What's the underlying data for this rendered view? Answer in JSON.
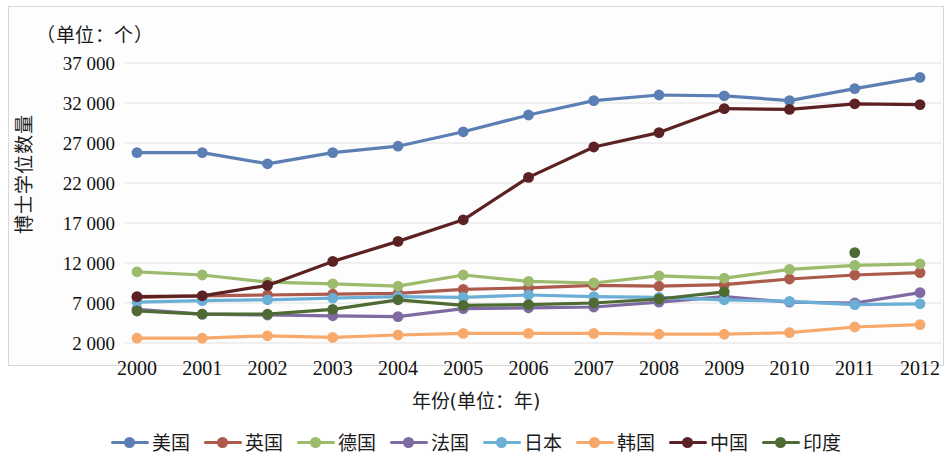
{
  "unit_note": "（单位：个）",
  "axis": {
    "x_title": "年份(单位：年)",
    "y_title": "博士学位数量"
  },
  "chart_data": {
    "type": "line",
    "title": "",
    "subtitle": "",
    "xlabel": "年份(单位：年)",
    "ylabel": "博士学位数量",
    "unit_annotation": "（单位：个）",
    "grid": true,
    "legend_position": "bottom",
    "categories": [
      "2000",
      "2001",
      "2002",
      "2003",
      "2004",
      "2005",
      "2006",
      "2007",
      "2008",
      "2009",
      "2010",
      "2011",
      "2012"
    ],
    "x": [
      2000,
      2001,
      2002,
      2003,
      2004,
      2005,
      2006,
      2007,
      2008,
      2009,
      2010,
      2011,
      2012
    ],
    "xlim": [
      2000,
      2012
    ],
    "ylim": [
      2000,
      37000
    ],
    "yticks": [
      2000,
      7000,
      12000,
      17000,
      22000,
      27000,
      32000,
      37000
    ],
    "ytick_labels": [
      "2 000",
      "7 000",
      "12 000",
      "17 000",
      "22 000",
      "27 000",
      "32 000",
      "37 000"
    ],
    "series": [
      {
        "name": "美国",
        "color": "#5B7FB4",
        "values": [
          25800,
          25800,
          24400,
          25800,
          26600,
          28400,
          30500,
          32300,
          33000,
          32900,
          32300,
          33800,
          35200
        ]
      },
      {
        "name": "英国",
        "color": "#AB5A4B",
        "values": [
          7700,
          7900,
          8000,
          8100,
          8200,
          8700,
          8900,
          9200,
          9100,
          9300,
          10000,
          10500,
          10800
        ]
      },
      {
        "name": "德国",
        "color": "#9CBB6C",
        "values": [
          10900,
          10500,
          9600,
          9400,
          9100,
          10500,
          9700,
          9500,
          10400,
          10100,
          11200,
          11700,
          11900
        ]
      },
      {
        "name": "法国",
        "color": "#7E6BA2",
        "values": [
          6200,
          5600,
          5500,
          5400,
          5300,
          6300,
          6400,
          6500,
          7100,
          7800,
          7100,
          7000,
          8300
        ]
      },
      {
        "name": "日本",
        "color": "#6BAED6",
        "values": [
          7100,
          7300,
          7400,
          7600,
          7800,
          7700,
          8000,
          7800,
          7700,
          7400,
          7200,
          6800,
          6900
        ]
      },
      {
        "name": "韩国",
        "color": "#F7A96C",
        "values": [
          2600,
          2600,
          2900,
          2700,
          3000,
          3200,
          3200,
          3200,
          3100,
          3100,
          3300,
          4000,
          4300
        ]
      },
      {
        "name": "中国",
        "color": "#5C2223",
        "values": [
          7800,
          7900,
          9200,
          12200,
          14700,
          17400,
          22700,
          26500,
          28300,
          31300,
          31200,
          31900,
          31800
        ]
      },
      {
        "name": "印度",
        "color": "#4E6B34",
        "values": [
          6000,
          5600,
          5600,
          6200,
          7400,
          6700,
          6800,
          7000,
          7500,
          8400,
          null,
          13300,
          null
        ]
      }
    ]
  },
  "legend": [
    {
      "label": "美国",
      "color": "#5B7FB4"
    },
    {
      "label": "英国",
      "color": "#AB5A4B"
    },
    {
      "label": "德国",
      "color": "#9CBB6C"
    },
    {
      "label": "法国",
      "color": "#7E6BA2"
    },
    {
      "label": "日本",
      "color": "#6BAED6"
    },
    {
      "label": "韩国",
      "color": "#F7A96C"
    },
    {
      "label": "中国",
      "color": "#5C2223"
    },
    {
      "label": "印度",
      "color": "#4E6B34"
    }
  ]
}
